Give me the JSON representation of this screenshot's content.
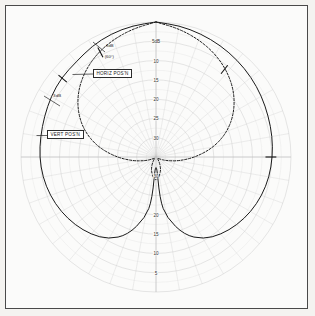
{
  "figure": {
    "background_color": "#f4f3f0",
    "frame_color": "#4a4a4a",
    "grid_color": "#cfcfcf",
    "curve_color": "#1a1a1a"
  },
  "annotations": {
    "horiz_label": "HORIZ POS'N",
    "vert_label": "VERT POS'N",
    "minus3db_line1": "-3dB",
    "minus3db_line2": "(60°)",
    "threedb_label": "3dB"
  },
  "chart_data": {
    "type": "line",
    "plot_kind": "polar",
    "title": "",
    "xlabel": "",
    "ylabel": "",
    "grid": true,
    "legend_position": "inline-callout",
    "radial_axis": {
      "unit": "dB",
      "direction": "inward-increasing-attenuation",
      "tick_labels_upper": [
        "5dB",
        "10",
        "15",
        "20",
        "25",
        "30"
      ],
      "tick_labels_lower": [
        "30",
        "20",
        "15",
        "10",
        "5"
      ],
      "tick_values": [
        5,
        10,
        15,
        20,
        25,
        30
      ],
      "rlim": [
        0,
        35
      ]
    },
    "angular_axis": {
      "spoke_interval_degrees": 10,
      "range_degrees": [
        0,
        360
      ]
    },
    "series": [
      {
        "name": "VERT POS'N",
        "style": "solid",
        "marker_ticks_degrees": [
          140,
          0
        ],
        "angles_deg": [
          90,
          100,
          110,
          120,
          130,
          140,
          150,
          160,
          170,
          180,
          190,
          200,
          210,
          220,
          230,
          240,
          250,
          260,
          265,
          270,
          275,
          280,
          290,
          300,
          310,
          320,
          330,
          340,
          350,
          0,
          10,
          20,
          30,
          40,
          50,
          60,
          70,
          80,
          90
        ],
        "radii_db": [
          0.0,
          0.4,
          1.0,
          1.8,
          2.8,
          3.0,
          3.6,
          4.2,
          4.6,
          4.8,
          5.2,
          5.8,
          6.6,
          7.6,
          8.8,
          10.4,
          13.5,
          19.0,
          24.0,
          35.0,
          24.0,
          19.0,
          13.5,
          10.4,
          8.8,
          7.6,
          6.6,
          5.8,
          5.2,
          4.8,
          4.4,
          4.0,
          3.4,
          2.8,
          2.2,
          1.6,
          1.0,
          0.4,
          0.0
        ]
      },
      {
        "name": "HORIZ POS'N",
        "style": "dashed",
        "marker_ticks_degrees": [
          118,
          52
        ],
        "angles_deg": [
          90,
          100,
          110,
          120,
          130,
          140,
          150,
          160,
          170,
          180,
          190,
          200,
          210,
          220,
          230,
          240,
          250,
          260,
          265,
          270,
          275,
          280,
          290,
          300,
          310,
          320,
          330,
          340,
          350,
          0,
          10,
          20,
          30,
          40,
          50,
          60,
          70,
          80,
          90
        ],
        "radii_db": [
          0.0,
          1.2,
          2.6,
          4.2,
          6.2,
          8.6,
          11.6,
          15.2,
          19.6,
          24.6,
          29.0,
          32.2,
          34.0,
          34.6,
          34.2,
          33.0,
          31.4,
          30.0,
          29.4,
          29.0,
          29.4,
          30.0,
          31.4,
          33.0,
          34.2,
          34.6,
          34.0,
          32.2,
          29.0,
          24.6,
          19.6,
          15.2,
          11.6,
          8.6,
          6.2,
          4.2,
          2.6,
          1.2,
          0.0
        ]
      }
    ],
    "callouts": [
      {
        "text": "-3dB (60°)",
        "target_series": "HORIZ POS'N",
        "angle_deg": 118
      },
      {
        "text": "3dB",
        "target_series": "VERT POS'N",
        "angle_deg": 152
      }
    ]
  }
}
